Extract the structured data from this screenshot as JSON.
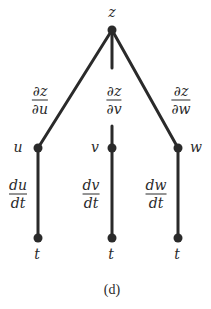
{
  "diagram": {
    "type": "tree",
    "caption": "(d)",
    "root": {
      "label": "z"
    },
    "middle_nodes": [
      {
        "label": "u",
        "edge_label": {
          "num": "∂z",
          "den": "∂u"
        }
      },
      {
        "label": "v",
        "edge_label": {
          "num": "∂z",
          "den": "∂v"
        }
      },
      {
        "label": "w",
        "edge_label": {
          "num": "∂z",
          "den": "∂w"
        }
      }
    ],
    "leaf_nodes": [
      {
        "label": "t",
        "edge_label": {
          "num": "du",
          "den": "dt"
        }
      },
      {
        "label": "t",
        "edge_label": {
          "num": "dv",
          "den": "dt"
        }
      },
      {
        "label": "t",
        "edge_label": {
          "num": "dw",
          "den": "dt"
        }
      }
    ],
    "colors": {
      "line": "#2a2a2a",
      "node": "#2a2a2a"
    }
  }
}
